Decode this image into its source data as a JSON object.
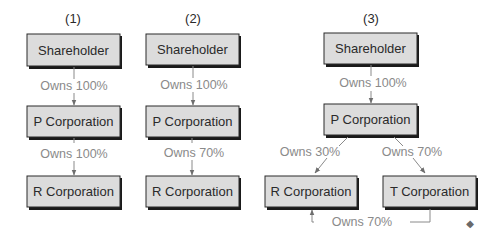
{
  "diagrams": [
    {
      "header": "(1)",
      "nodes": {
        "top": "Shareholder",
        "mid": "P Corporation",
        "bottom": "R Corporation"
      },
      "edges": {
        "top_to_mid": "Owns 100%",
        "mid_to_bottom": "Owns 100%"
      }
    },
    {
      "header": "(2)",
      "nodes": {
        "top": "Shareholder",
        "mid": "P Corporation",
        "bottom": "R Corporation"
      },
      "edges": {
        "top_to_mid": "Owns 100%",
        "mid_to_bottom": "Owns 70%"
      }
    },
    {
      "header": "(3)",
      "nodes": {
        "top": "Shareholder",
        "mid": "P Corporation",
        "left": "R Corporation",
        "right": "T Corporation"
      },
      "edges": {
        "top_to_mid": "Owns 100%",
        "mid_to_left": "Owns 30%",
        "mid_to_right": "Owns 70%",
        "right_to_left": "Owns 70%"
      }
    }
  ],
  "end_marker": "◆",
  "colors": {
    "box_fill": "#dcdcdc",
    "box_border": "#2a2a2a",
    "label_text": "#8a8a8a",
    "arrow": "#6e6e6e"
  }
}
